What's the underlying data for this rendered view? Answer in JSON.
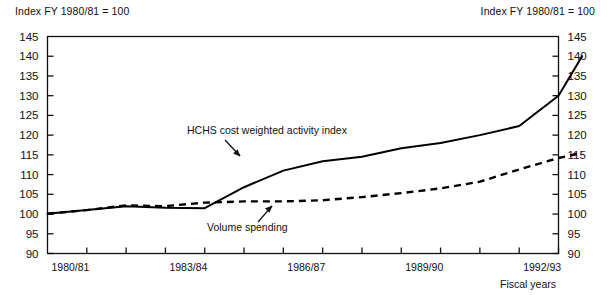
{
  "header": {
    "left_note": "Index FY 1980/81 = 100",
    "right_note": "Index FY 1980/81 = 100"
  },
  "chart_data": {
    "type": "line",
    "title": "",
    "subtitle": "",
    "xlabel": "Fiscal years",
    "ylabel": "Index FY 1980/81 = 100",
    "grid": false,
    "legend_position": "inline-annotations",
    "ylim": [
      90,
      145
    ],
    "ytick_values": [
      90,
      95,
      100,
      105,
      110,
      115,
      120,
      125,
      130,
      135,
      140,
      145
    ],
    "ytick_labels": [
      "90",
      "95",
      "100",
      "105",
      "110",
      "115",
      "120",
      "125",
      "130",
      "135",
      "140",
      "145"
    ],
    "y_axis_both_sides": true,
    "x": [
      "1980/81",
      "1981/82",
      "1982/83",
      "1983/84",
      "1984/85",
      "1985/86",
      "1986/87",
      "1987/88",
      "1988/89",
      "1989/90",
      "1990/91",
      "1991/92",
      "1992/93",
      "1993/94"
    ],
    "xtick_labels_shown": [
      "1980/81",
      "1983/84",
      "1986/87",
      "1989/90",
      "1992/93"
    ],
    "xtick_label_indices": [
      0,
      3,
      6,
      9,
      12
    ],
    "series": [
      {
        "name": "HCHS cost weighted activity index",
        "style": "solid",
        "color": "#000000",
        "values": [
          100.1,
          101.0,
          102.0,
          101.6,
          101.5,
          106.8,
          111.0,
          113.4,
          114.5,
          116.7,
          118.0,
          120.0,
          122.3,
          130.0
        ]
      },
      {
        "name": "Volume spending",
        "style": "dashed",
        "color": "#000000",
        "values": [
          100.1,
          101.0,
          102.2,
          102.0,
          102.9,
          103.2,
          103.2,
          103.5,
          104.3,
          105.3,
          106.5,
          108.2,
          111.3,
          114.2
        ]
      }
    ],
    "series_extra_points": {
      "HCHS cost weighted activity index": {
        "final_index": 13.6,
        "final_value": 140.0
      },
      "Volume spending": {
        "final_index": 13.6,
        "final_value": 115.5
      }
    },
    "annotations": [
      {
        "text": "HCHS cost weighted activity index",
        "points_to_series": "HCHS cost weighted activity index"
      },
      {
        "text": "Volume spending",
        "points_to_series": "Volume spending"
      }
    ]
  }
}
